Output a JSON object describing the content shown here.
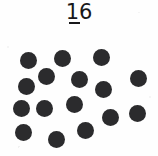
{
  "card": {
    "width": 158,
    "height": 156,
    "background_color": "#fefefe"
  },
  "label": {
    "numeral": "16",
    "underlined_digit": "1",
    "color": "#18181a"
  },
  "dots": {
    "count": 16,
    "color": "#2b2b2d",
    "diameter": 17,
    "field_origin_y": 34,
    "positions": [
      {
        "x": 28,
        "y": 60
      },
      {
        "x": 62,
        "y": 58
      },
      {
        "x": 101,
        "y": 57
      },
      {
        "x": 46,
        "y": 76
      },
      {
        "x": 79,
        "y": 79
      },
      {
        "x": 138,
        "y": 78
      },
      {
        "x": 26,
        "y": 86
      },
      {
        "x": 103,
        "y": 89
      },
      {
        "x": 21,
        "y": 108
      },
      {
        "x": 44,
        "y": 108
      },
      {
        "x": 74,
        "y": 104
      },
      {
        "x": 137,
        "y": 113
      },
      {
        "x": 110,
        "y": 117
      },
      {
        "x": 23,
        "y": 132
      },
      {
        "x": 56,
        "y": 139
      },
      {
        "x": 85,
        "y": 130
      }
    ]
  }
}
